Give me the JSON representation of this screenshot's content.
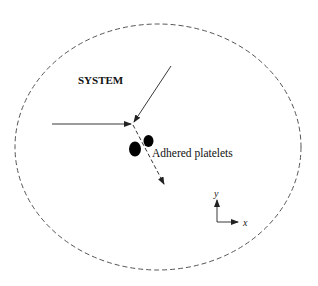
{
  "diagram": {
    "system_label": "SYSTEM",
    "platelets_label": "Adhered platelets",
    "axes": {
      "x_label": "x",
      "y_label": "y"
    },
    "colors": {
      "boundary": "#555555",
      "arrow": "#222222",
      "platelet": "#000000"
    },
    "elements": [
      {
        "id": "system-boundary",
        "type": "dashed-ellipse"
      },
      {
        "id": "incoming-arrow-horizontal",
        "type": "solid-arrow",
        "direction": "right"
      },
      {
        "id": "incoming-arrow-diagonal",
        "type": "solid-arrow",
        "direction": "down-left"
      },
      {
        "id": "outgoing-arrow",
        "type": "dashed-arrow",
        "direction": "down-right"
      },
      {
        "id": "platelet-1",
        "type": "filled-ellipse"
      },
      {
        "id": "platelet-2",
        "type": "filled-ellipse"
      }
    ]
  }
}
